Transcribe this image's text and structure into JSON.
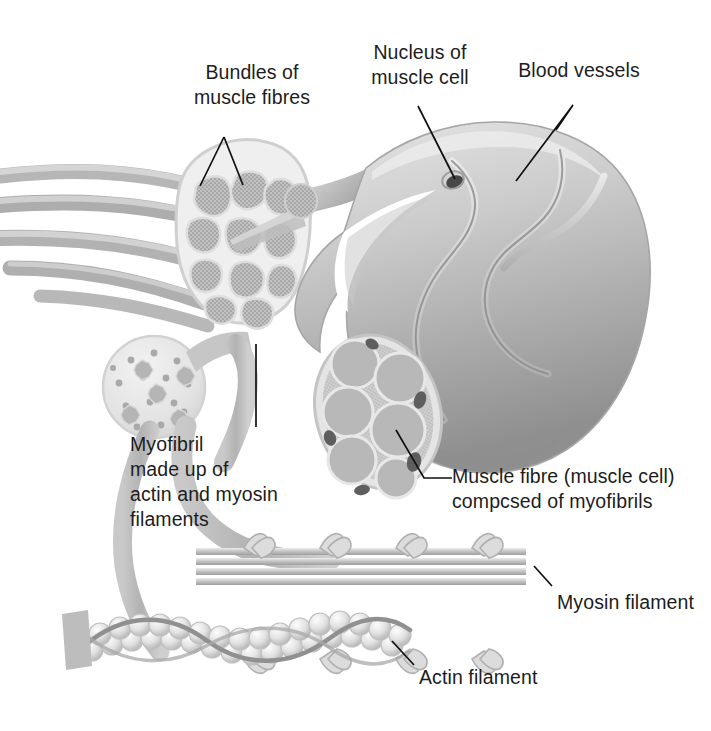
{
  "figure": {
    "background": "#ffffff",
    "ink": "#1d1d1d"
  },
  "labels": {
    "bundles": "Bundles of\nmuscle fibres",
    "nucleus": "Nucleus of\nmuscle cell",
    "blood_vessels": "Blood vessels",
    "myofibril": "Myofibril\nmade up of\nactin and myosin\nfilaments",
    "muscle_fibre": "Muscle fibre (muscle cell)\ncompcsed of myofibrils",
    "myosin": "Myosin filament",
    "actin": "Actin filament"
  },
  "structures": {
    "muscle_belly": "muscle-belly",
    "fascicle_cross_section": "bundle-cross-section",
    "fibre_cross_section": "muscle-fibre-cross-section",
    "myofibril_cross_section": "myofibril-cross-section",
    "myosin_filament": "myosin-filament",
    "actin_filament": "actin-filament",
    "tendon_stalk": "tendon-stalk",
    "connector_ribbons": "connector-ribbons"
  },
  "palette": {
    "tissue_light": "#d8d8d8",
    "tissue_mid": "#b9b9b9",
    "tissue_dark": "#8e8e8e",
    "outline": "#9a9a9a",
    "vessel": "#8a8a8a",
    "nucleus": "#4a4a4a",
    "bead": "#ededed",
    "leader": "#111111"
  }
}
